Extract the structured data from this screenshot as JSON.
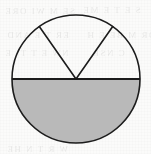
{
  "figure": {
    "name": "circle-with-shaded-semicircle-and-sector",
    "kind": "geometry-diagram",
    "caption": "",
    "canvas": {
      "width": 151,
      "height": 154
    },
    "background_color": "#fbfbfa",
    "stroke_color": "#1c1c1c",
    "shade_color": "#b9b9b9",
    "stroke_width": 1.6
  },
  "circle": {
    "center_x": 76,
    "center_y": 79,
    "radius": 64,
    "fill": "none",
    "stroke": "#1c1c1c"
  },
  "diameter": {
    "label": "horizontal diameter",
    "x1": 12,
    "y1": 79,
    "x2": 140,
    "y2": 79
  },
  "shaded_region": {
    "label": "lower semicircle",
    "fill": "#b9b9b9",
    "angle_degrees": 180
  },
  "sector": {
    "label": "upper sector",
    "apex_x": 76,
    "apex_y": 79,
    "start_angle_degrees": 55,
    "end_angle_degrees": 125,
    "angle_degrees": 70,
    "fill": "none",
    "radius_left": {
      "x": 39,
      "y": 26
    },
    "radius_right": {
      "x": 113,
      "y": 26
    }
  },
  "ghost_text": {
    "note": "faint show-through from reverse of scanned page; illegible",
    "lines": [
      {
        "text": "SE M WI ORE",
        "x": 4,
        "y": 6,
        "size": 9
      },
      {
        "text": "S E T E ME",
        "x": 82,
        "y": 5,
        "size": 9
      },
      {
        "text": "ER T E AND",
        "x": 6,
        "y": 30,
        "size": 9
      },
      {
        "text": "OR M BE E H",
        "x": 86,
        "y": 30,
        "size": 9
      },
      {
        "text": "NW E T TI E",
        "x": 4,
        "y": 48,
        "size": 9
      },
      {
        "text": "C NSE",
        "x": 92,
        "y": 48,
        "size": 9
      },
      {
        "text": "E DO OI HI AT",
        "x": 30,
        "y": 96,
        "size": 9
      },
      {
        "text": "W R T N HE",
        "x": 6,
        "y": 144,
        "size": 9
      }
    ]
  }
}
